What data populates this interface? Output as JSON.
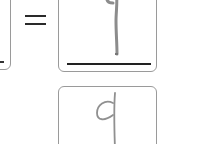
{
  "worksheet": {
    "equation": {
      "operator": "=",
      "left_box": {
        "numerator": "",
        "denominator": ""
      },
      "right_box": {
        "numerator_handwritten": "9",
        "denominator_handwritten": ""
      }
    },
    "answer_box": {
      "handwritten": "9"
    }
  },
  "colors": {
    "box_border": "#9a9a9a",
    "ink_pencil": "#8c8c8c",
    "line_black": "#222222"
  }
}
